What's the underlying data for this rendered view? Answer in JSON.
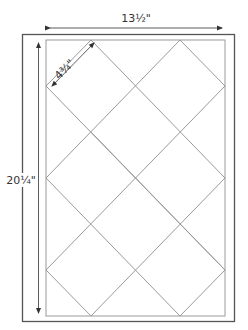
{
  "diagram": {
    "type": "quilt-layout",
    "dimensions": {
      "width_label": "13½\"",
      "height_label": "20¼\"",
      "block_label": "4¾\""
    },
    "colors": {
      "outer_border": "#555555",
      "inner_border": "#999999",
      "grid_lines": "#999999",
      "arrows": "#333333",
      "text": "#333333",
      "background": "#ffffff"
    },
    "outer_rect": {
      "x": 22,
      "y": 34,
      "width": 213,
      "height": 288
    },
    "inner_rect": {
      "x": 46,
      "y": 40,
      "width": 179,
      "height": 276
    },
    "grid": {
      "columns_x": [
        46,
        91,
        136,
        180,
        225
      ],
      "rows_y": [
        40,
        86,
        132,
        178,
        224,
        270,
        316
      ]
    }
  }
}
